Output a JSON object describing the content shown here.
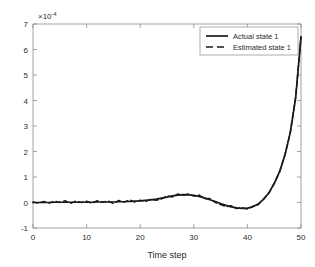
{
  "figure": {
    "background_color": "#ffffff",
    "axes_color": "#8c8c8c",
    "line_color": "#1a1a1a"
  },
  "chart_data": {
    "type": "line",
    "title": "",
    "xlabel": "Time step",
    "ylabel": "",
    "exponent_label": "×10",
    "exponent_power": "-4",
    "y_scale_factor": 0.0001,
    "xlim": [
      0,
      50
    ],
    "ylim": [
      -1,
      7
    ],
    "xticks": [
      0,
      10,
      20,
      30,
      40,
      50
    ],
    "xtick_labels": [
      "0",
      "10",
      "20",
      "30",
      "40",
      "50"
    ],
    "yticks": [
      -1,
      0,
      1,
      2,
      3,
      4,
      5,
      6,
      7
    ],
    "ytick_labels": [
      "-1",
      "0",
      "1",
      "2",
      "3",
      "4",
      "5",
      "6",
      "7"
    ],
    "grid": false,
    "legend_position": "top-right",
    "legend": [
      "Actual state 1",
      "Estimated state 1"
    ],
    "x": [
      0,
      1,
      2,
      3,
      4,
      5,
      6,
      7,
      8,
      9,
      10,
      11,
      12,
      13,
      14,
      15,
      16,
      17,
      18,
      19,
      20,
      21,
      22,
      23,
      24,
      25,
      26,
      27,
      28,
      29,
      30,
      31,
      32,
      33,
      34,
      35,
      36,
      37,
      38,
      39,
      40,
      41,
      42,
      43,
      44,
      45,
      46,
      47,
      48,
      49,
      50
    ],
    "series": [
      {
        "name": "Actual state 1",
        "style": "solid",
        "values": [
          0.0,
          0.0,
          0.0,
          0.0,
          0.01,
          0.01,
          0.01,
          0.01,
          0.01,
          0.01,
          0.01,
          0.01,
          0.02,
          0.02,
          0.02,
          0.02,
          0.03,
          0.03,
          0.04,
          0.05,
          0.06,
          0.08,
          0.1,
          0.13,
          0.17,
          0.21,
          0.26,
          0.29,
          0.31,
          0.3,
          0.28,
          0.24,
          0.18,
          0.11,
          0.04,
          -0.04,
          -0.11,
          -0.17,
          -0.21,
          -0.23,
          -0.22,
          -0.17,
          -0.06,
          0.12,
          0.38,
          0.74,
          1.21,
          1.85,
          2.75,
          4.1,
          6.5
        ]
      },
      {
        "name": "Estimated state 1",
        "style": "dashed",
        "values": [
          0.02,
          -0.03,
          0.04,
          -0.02,
          0.05,
          0.0,
          0.07,
          -0.04,
          0.06,
          0.0,
          0.05,
          -0.03,
          0.07,
          0.01,
          0.06,
          -0.04,
          0.08,
          0.02,
          0.1,
          0.02,
          0.09,
          0.04,
          0.13,
          0.09,
          0.14,
          0.26,
          0.22,
          0.33,
          0.28,
          0.34,
          0.25,
          0.29,
          0.14,
          0.16,
          0.0,
          -0.08,
          -0.16,
          -0.13,
          -0.24,
          -0.2,
          -0.26,
          -0.15,
          -0.09,
          0.14,
          0.36,
          0.76,
          1.19,
          1.87,
          2.73,
          4.12,
          6.48
        ]
      }
    ]
  }
}
